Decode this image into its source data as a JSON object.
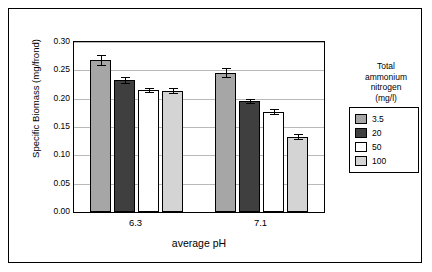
{
  "chart_data": {
    "type": "bar",
    "title": "",
    "xlabel": "average  pH",
    "ylabel": "Specific Biomass (mg/frond)",
    "categories": [
      "6.3",
      "7.1"
    ],
    "ylim": [
      0.0,
      0.3
    ],
    "yticks": [
      "0.00",
      "0.05",
      "0.10",
      "0.15",
      "0.20",
      "0.25",
      "0.30"
    ],
    "ytick_values": [
      0.0,
      0.05,
      0.1,
      0.15,
      0.2,
      0.25,
      0.3
    ],
    "grid": true,
    "legend_position": "right",
    "legend_title": "Total ammonium nitrogen (mg/l)",
    "legend_title_lines": [
      "Total",
      "ammonium",
      "nitrogen",
      "(mg/l)"
    ],
    "series": [
      {
        "name": "3.5",
        "color": "#a6a6a6",
        "values": [
          0.268,
          0.246
        ],
        "errors": [
          0.009,
          0.008
        ]
      },
      {
        "name": "20",
        "color": "#3f3f3f",
        "values": [
          0.233,
          0.196
        ],
        "errors": [
          0.005,
          0.003
        ]
      },
      {
        "name": "50",
        "color": "#ffffff",
        "values": [
          0.215,
          0.177
        ],
        "errors": [
          0.003,
          0.004
        ]
      },
      {
        "name": "100",
        "color": "#d4d4d4",
        "values": [
          0.214,
          0.133
        ],
        "errors": [
          0.004,
          0.004
        ]
      }
    ]
  }
}
